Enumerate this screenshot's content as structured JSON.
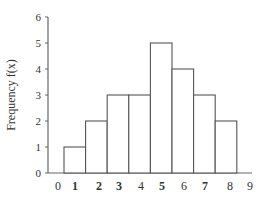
{
  "chart_data": {
    "type": "bar",
    "subtype": "histogram",
    "title": "",
    "xlabel": "",
    "ylabel": "Frequency  f(x)",
    "categories": [
      "1",
      "2",
      "3",
      "4",
      "5",
      "6",
      "7",
      "8"
    ],
    "values": [
      1,
      2,
      3,
      3,
      5,
      4,
      3,
      2
    ],
    "x_ticks": [
      "0",
      "1",
      "2",
      "3",
      "4",
      "5",
      "6",
      "7",
      "8",
      "9"
    ],
    "y_ticks": [
      "0",
      "1",
      "2",
      "3",
      "4",
      "5",
      "6"
    ],
    "ylim": [
      0,
      6
    ],
    "grid": false,
    "legend": null,
    "bar_fill": "#ffffff",
    "bar_stroke": "#555555",
    "axis_color": "#666666"
  }
}
